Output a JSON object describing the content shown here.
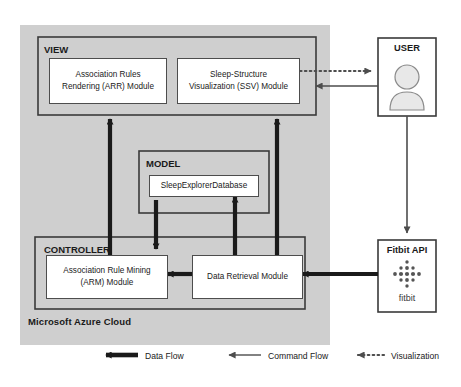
{
  "diagram": {
    "cloud": {
      "label": "Microsoft Azure Cloud"
    },
    "view": {
      "title": "VIEW",
      "modules": [
        {
          "name": "arr-module",
          "line1": "Association Rules",
          "line2": "Rendering (ARR) Module"
        },
        {
          "name": "ssv-module",
          "line1": "Sleep-Structure",
          "line2": "Visualization (SSV) Module"
        }
      ]
    },
    "model": {
      "title": "MODEL",
      "modules": [
        {
          "name": "sleep-explorer-database",
          "line1": "SleepExplorerDatabase",
          "line2": ""
        }
      ]
    },
    "controller": {
      "title": "CONTROLLER",
      "modules": [
        {
          "name": "arm-module",
          "line1": "Association Rule Mining",
          "line2": "(ARM) Module"
        },
        {
          "name": "data-retrieval-module",
          "line1": "Data Retrieval Module",
          "line2": ""
        }
      ]
    },
    "external": [
      {
        "name": "user-box",
        "title": "USER",
        "icon": "person-icon"
      },
      {
        "name": "fitbit-api-box",
        "title": "Fitbit API",
        "icon": "fitbit-dots-icon",
        "wordmark": "fitbit"
      }
    ],
    "legend": [
      {
        "name": "legend-data-flow",
        "label": "Data Flow",
        "style": "thick-solid",
        "color": "#1a1a1a"
      },
      {
        "name": "legend-command-flow",
        "label": "Command Flow",
        "style": "thin-solid",
        "color": "#4d4d4d"
      },
      {
        "name": "legend-visualization",
        "label": "Visualization",
        "style": "dotted",
        "color": "#4d4d4d"
      }
    ]
  },
  "colors": {
    "cloud_fill": "#cfcfcf",
    "box_stroke": "#4d4d4d",
    "data_flow": "#1a1a1a",
    "command_flow": "#4d4d4d",
    "module_fill": "#ffffff"
  }
}
